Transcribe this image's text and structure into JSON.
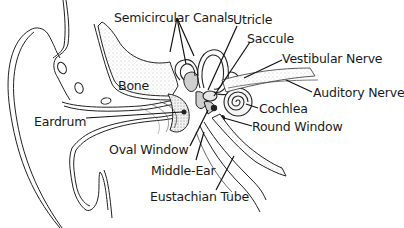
{
  "diagram": {
    "style": "black-and-white line illustration",
    "labels": [
      {
        "id": "semicircular-canals",
        "text": "Semicircular Canals",
        "x": 114,
        "y": 12
      },
      {
        "id": "utricle",
        "text": "Utricle",
        "x": 233,
        "y": 14
      },
      {
        "id": "saccule",
        "text": "Saccule",
        "x": 247,
        "y": 33
      },
      {
        "id": "vestibular-nerve",
        "text": "Vestibular Nerve",
        "x": 282,
        "y": 53
      },
      {
        "id": "bone",
        "text": "Bone",
        "x": 118,
        "y": 80
      },
      {
        "id": "auditory-nerve",
        "text": "Auditory Nerve",
        "x": 313,
        "y": 87
      },
      {
        "id": "cochlea",
        "text": "Cochlea",
        "x": 259,
        "y": 103
      },
      {
        "id": "eardrum",
        "text": "Eardrum",
        "x": 34,
        "y": 116
      },
      {
        "id": "round-window",
        "text": "Round Window",
        "x": 252,
        "y": 121
      },
      {
        "id": "oval-window",
        "text": "Oval Window",
        "x": 109,
        "y": 144
      },
      {
        "id": "middle-ear",
        "text": "Middle-Ear",
        "x": 151,
        "y": 165
      },
      {
        "id": "eustachian-tube",
        "text": "Eustachian Tube",
        "x": 150,
        "y": 191
      }
    ],
    "colors": {
      "background": "#ffffff",
      "ink": "#1a1a1a",
      "stipple": "#9a9a9a"
    }
  }
}
